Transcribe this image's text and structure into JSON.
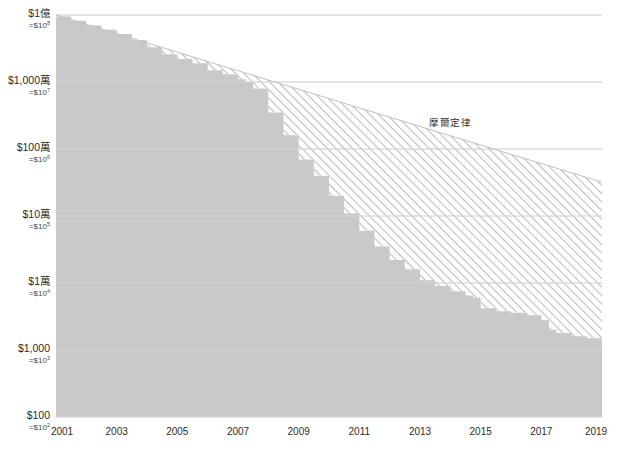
{
  "chart_data": {
    "type": "area",
    "title": "",
    "subtitle": "",
    "xlabel": "",
    "ylabel": "",
    "scale": "log",
    "grid": true,
    "legend_position": "inline-annotation",
    "xlim": [
      2001,
      2019
    ],
    "ylim": [
      100,
      100000000
    ],
    "x_ticks": [
      "2001",
      "2003",
      "2005",
      "2007",
      "2009",
      "2011",
      "2013",
      "2015",
      "2017",
      "2019"
    ],
    "x_tick_values": [
      2001,
      2003,
      2005,
      2007,
      2009,
      2011,
      2013,
      2015,
      2017,
      2019
    ],
    "y_ticks": [
      {
        "main": "$1億",
        "sub_prefix": "=$10",
        "sub_exp": "8",
        "value": 100000000
      },
      {
        "main": "$1,000萬",
        "sub_prefix": "=$10",
        "sub_exp": "7",
        "value": 10000000
      },
      {
        "main": "$100萬",
        "sub_prefix": "=$10",
        "sub_exp": "6",
        "value": 1000000
      },
      {
        "main": "$10萬",
        "sub_prefix": "=$10",
        "sub_exp": "5",
        "value": 100000
      },
      {
        "main": "$1萬",
        "sub_prefix": "=$10",
        "sub_exp": "4",
        "value": 10000
      },
      {
        "main": "$1,000",
        "sub_prefix": "=$10",
        "sub_exp": "3",
        "value": 1000
      },
      {
        "main": "$100",
        "sub_prefix": "=$10",
        "sub_exp": "2",
        "value": 100
      }
    ],
    "annotations": [
      {
        "text": "摩爾定律",
        "x": 2014.0,
        "y": 2200000
      }
    ],
    "series": [
      {
        "name": "摩爾定律",
        "style": "line-upper-bound",
        "x": [
          2001,
          2019
        ],
        "values": [
          100000000,
          320000
        ]
      },
      {
        "name": "actual-cost",
        "style": "filled-area",
        "x": [
          2001,
          2001.5,
          2002,
          2002.5,
          2003,
          2003.5,
          2004,
          2004.5,
          2005,
          2005.5,
          2006,
          2006.5,
          2007,
          2007.25,
          2007.5,
          2008,
          2008.5,
          2009,
          2009.5,
          2010,
          2010.5,
          2011,
          2011.5,
          2012,
          2012.5,
          2013,
          2013.5,
          2014,
          2014.5,
          2014.75,
          2015,
          2015.5,
          2016,
          2016.5,
          2017,
          2017.25,
          2017.5,
          2018,
          2018.5,
          2019
        ],
        "values": [
          95000000,
          82000000,
          70000000,
          60000000,
          52000000,
          42000000,
          33000000,
          26000000,
          22000000,
          19000000,
          15000000,
          13000000,
          11000000,
          10000000,
          8000000,
          3500000,
          1600000,
          700000,
          400000,
          200000,
          110000,
          60000,
          35000,
          22000,
          16000,
          11000,
          9000,
          7500,
          6500,
          6000,
          4200,
          3800,
          3600,
          3300,
          2800,
          2000,
          1800,
          1600,
          1500,
          1100
        ]
      }
    ],
    "colors": {
      "area_fill": "#c9c9c9",
      "hatch_line": "#b8b8b8",
      "gridline": "#e2e2e2",
      "gridline_over_fill": "#d6d6d6",
      "label_text": "#2b2b2b",
      "annotation_text": "#2f2f2f",
      "background": "#ffffff"
    }
  },
  "axis": {
    "y_title": "",
    "x_title": ""
  }
}
